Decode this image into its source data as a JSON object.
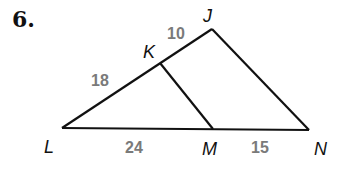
{
  "problem": {
    "number": "6."
  },
  "diagram": {
    "vertices": {
      "J": {
        "label": "J",
        "x": 212,
        "y": 29
      },
      "K": {
        "label": "K",
        "x": 160,
        "y": 63
      },
      "L": {
        "label": "L",
        "x": 62,
        "y": 128
      },
      "M": {
        "label": "M",
        "x": 213,
        "y": 129
      },
      "N": {
        "label": "N",
        "x": 309,
        "y": 130
      }
    },
    "segments": [
      {
        "from": "L",
        "to": "J"
      },
      {
        "from": "J",
        "to": "N"
      },
      {
        "from": "L",
        "to": "N"
      },
      {
        "from": "K",
        "to": "M"
      }
    ],
    "lengths": {
      "LK": "18",
      "KJ": "10",
      "LM": "24",
      "MN": "15"
    },
    "colors": {
      "line": "#111111",
      "length_text": "#7a7a7a"
    }
  }
}
